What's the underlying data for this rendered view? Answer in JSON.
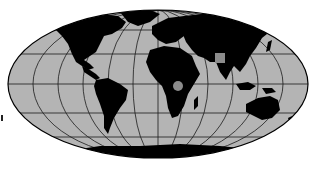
{
  "map": {
    "projection": "mollweide",
    "colors": {
      "ocean": "#b4b4b4",
      "land": "#000000",
      "graticule": "#1a1a1a",
      "outline": "#000000",
      "marker": "#8c8c8c",
      "background": "#ffffff"
    },
    "graticule": {
      "meridian_count": 12,
      "parallels_y": [
        30,
        54,
        84,
        113,
        137
      ]
    },
    "markers": [
      {
        "type": "square",
        "label": "",
        "region": "Central Asia"
      },
      {
        "type": "circle",
        "label": "",
        "region": "Central Africa"
      }
    ]
  }
}
